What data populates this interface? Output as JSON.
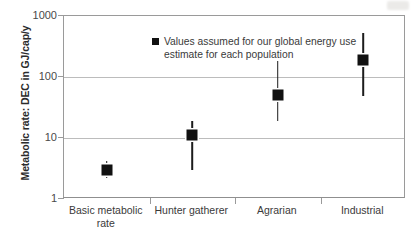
{
  "chart_data": {
    "type": "scatter",
    "title": "",
    "xlabel": "",
    "ylabel": "Metabolic rate: DEC in GJ/cap/y",
    "categories": [
      "Basic metabolic\nrate",
      "Hunter gatherer",
      "Agrarian",
      "Industrial"
    ],
    "values": [
      3,
      11,
      50,
      190
    ],
    "error_low": [
      2.2,
      3.0,
      19,
      48
    ],
    "error_high": [
      4.2,
      19,
      180,
      520
    ],
    "yscale": "log",
    "ylim": [
      1,
      1000
    ],
    "yticks": [
      1,
      10,
      100,
      1000
    ],
    "ytick_labels": [
      "1",
      "10",
      "100",
      "1000"
    ],
    "grid": "horizontal",
    "legend_position": "top-left-inside",
    "series": [
      {
        "name": "Values assumed for our global energy use estimate for each population",
        "marker": "filled-square",
        "color": "#111111",
        "values": [
          3,
          11,
          50,
          190
        ]
      }
    ],
    "legend": [
      "Values assumed for our global energy use estimate for each population"
    ]
  },
  "legend": {
    "marker_icon": "filled-square-legend-icon",
    "label": "Values assumed for our global energy use estimate for each population"
  },
  "axes": {
    "y_title": "Metabolic rate: DEC in GJ/cap/y",
    "y_ticks": [
      "1000",
      "100",
      "10",
      "1"
    ],
    "x_ticks": [
      "Basic metabolic\nrate",
      "Hunter gatherer",
      "Agrarian",
      "Industrial"
    ]
  },
  "colors": {
    "marker": "#111111",
    "gridline": "#bcbcbc",
    "axis": "#9a9a9a",
    "text": "#3a3a3a",
    "background": "#ffffff"
  }
}
